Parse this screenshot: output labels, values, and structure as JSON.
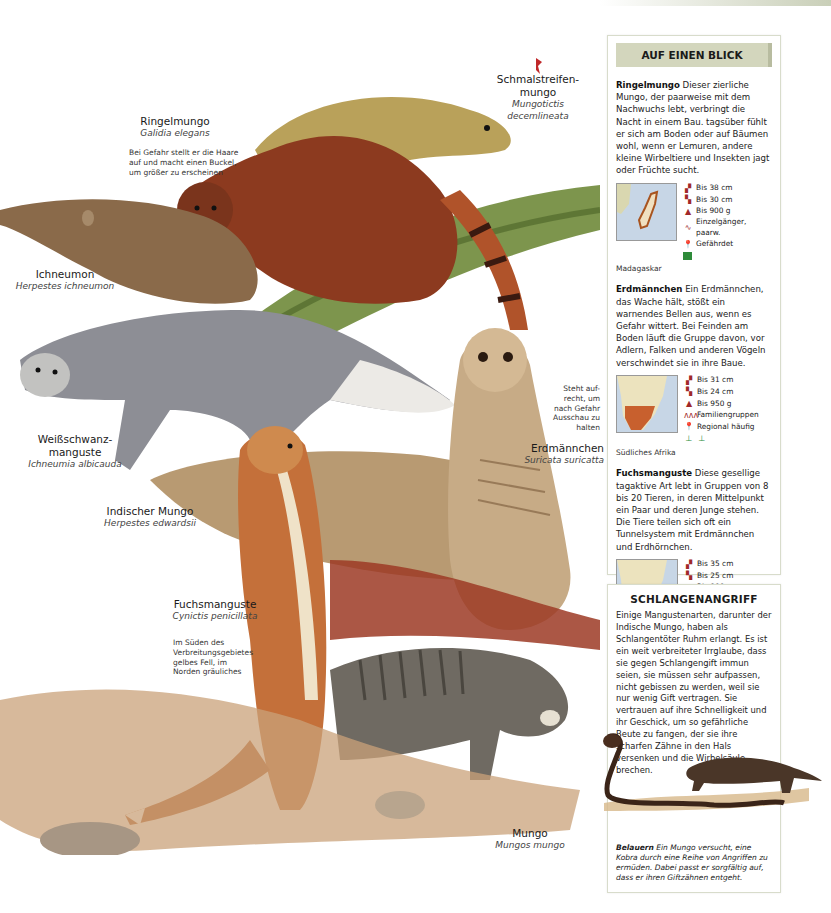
{
  "illustration": {
    "species": [
      {
        "common": "Schmalstreifen-",
        "common2": "mungo",
        "latin": "Mungotictis",
        "latin2": "decemlineata"
      },
      {
        "common": "Ringelmungo",
        "latin": "Galidia elegans",
        "note": [
          "Bei Gefahr stellt er die Haare",
          "auf und macht einen Buckel,",
          "um größer zu erscheinen"
        ]
      },
      {
        "common": "Ichneumon",
        "latin": "Herpestes ichneumon"
      },
      {
        "common": "Weißschwanz-",
        "common2": "manguste",
        "latin": "Ichneumia albicauda"
      },
      {
        "common": "Indischer Mungo",
        "latin": "Herpestes edwardsii"
      },
      {
        "common": "Erdmännchen",
        "latin": "Suricata suricatta",
        "note": [
          "Steht auf-",
          "recht, um",
          "nach Gefahr",
          "Ausschau zu",
          "halten"
        ]
      },
      {
        "common": "Fuchsmanguste",
        "latin": "Cynictis penicillata",
        "note": [
          "Im Süden des",
          "Verbreitungsgebietes",
          "gelbes Fell, im",
          "Norden gräuliches"
        ]
      },
      {
        "common": "Mungo",
        "latin": "Mungos mungo"
      }
    ]
  },
  "glance": {
    "title": "AUF EINEN BLICK",
    "entries": [
      {
        "name": "Ringelmungo",
        "text": "Dieser zierliche Mungo, der paarweise mit dem Nachwuchs lebt, verbringt die Nacht in einem Bau. tagsüber fühlt er sich am Boden oder auf Bäumen wohl, wenn er Lemuren, andere kleine Wirbeltiere und Insekten jagt oder Früchte sucht.",
        "facts": [
          "Bis 38 cm",
          "Bis 30 cm",
          "Bis 900 g",
          "Einzelgänger, paarw.",
          "Gefährdet"
        ],
        "region": "Madagaskar"
      },
      {
        "name": "Erdmännchen",
        "text": "Ein Erdmännchen, das Wache hält, stößt ein warnendes Bellen aus, wenn es Gefahr wittert. Bei Feinden am Boden läuft die Gruppe davon, vor Adlern, Falken und anderen Vögeln verschwindet sie in ihre Baue.",
        "facts": [
          "Bis 31 cm",
          "Bis 24 cm",
          "Bis 950 g",
          "Familiengruppen",
          "Regional häufig"
        ],
        "region": "Südliches Afrika"
      },
      {
        "name": "Fuchsmanguste",
        "text": "Diese gesellige tagaktive Art lebt in Gruppen von 8 bis 20 Tieren, in deren Mittelpunkt ein Paar und deren Junge stehen. Die Tiere teilen sich oft ein Tunnelsystem mit Erdmännchen und Erdhörnchen.",
        "facts": [
          "Bis 35 cm",
          "Bis 25 cm",
          "Bis 900 g",
          "Familiengruppen",
          "Regional häufig"
        ],
        "region": "Südliches Afrika"
      }
    ]
  },
  "snake": {
    "title": "SCHLANGENANGRIFF",
    "text": "Einige Mangustenarten, darunter der Indische Mungo, haben als Schlangentöter Ruhm erlangt. Es ist ein weit verbreiteter Irrglaube, dass sie gegen Schlangengift immun seien, sie müssen sehr aufpassen, nicht gebissen zu werden, weil sie nur wenig Gift vertragen. Sie vertrauen auf ihre Schnelligkeit und ihr Geschick, um so gefährliche Beute zu fangen, der sie ihre scharfen Zähne in den Hals versenken und die Wirbelsäule brechen.",
    "caption_bold": "Belauern",
    "caption": "Ein Mungo versucht, eine Kobra durch eine Reihe von Angriffen zu ermüden. Dabei passt er sorgfältig auf, dass er ihren Giftzähnen entgeht."
  },
  "colors": {
    "header_bg": "#d3d6bd",
    "icon_red": "#a0282a",
    "habitat_green": "#2e8b3a"
  }
}
